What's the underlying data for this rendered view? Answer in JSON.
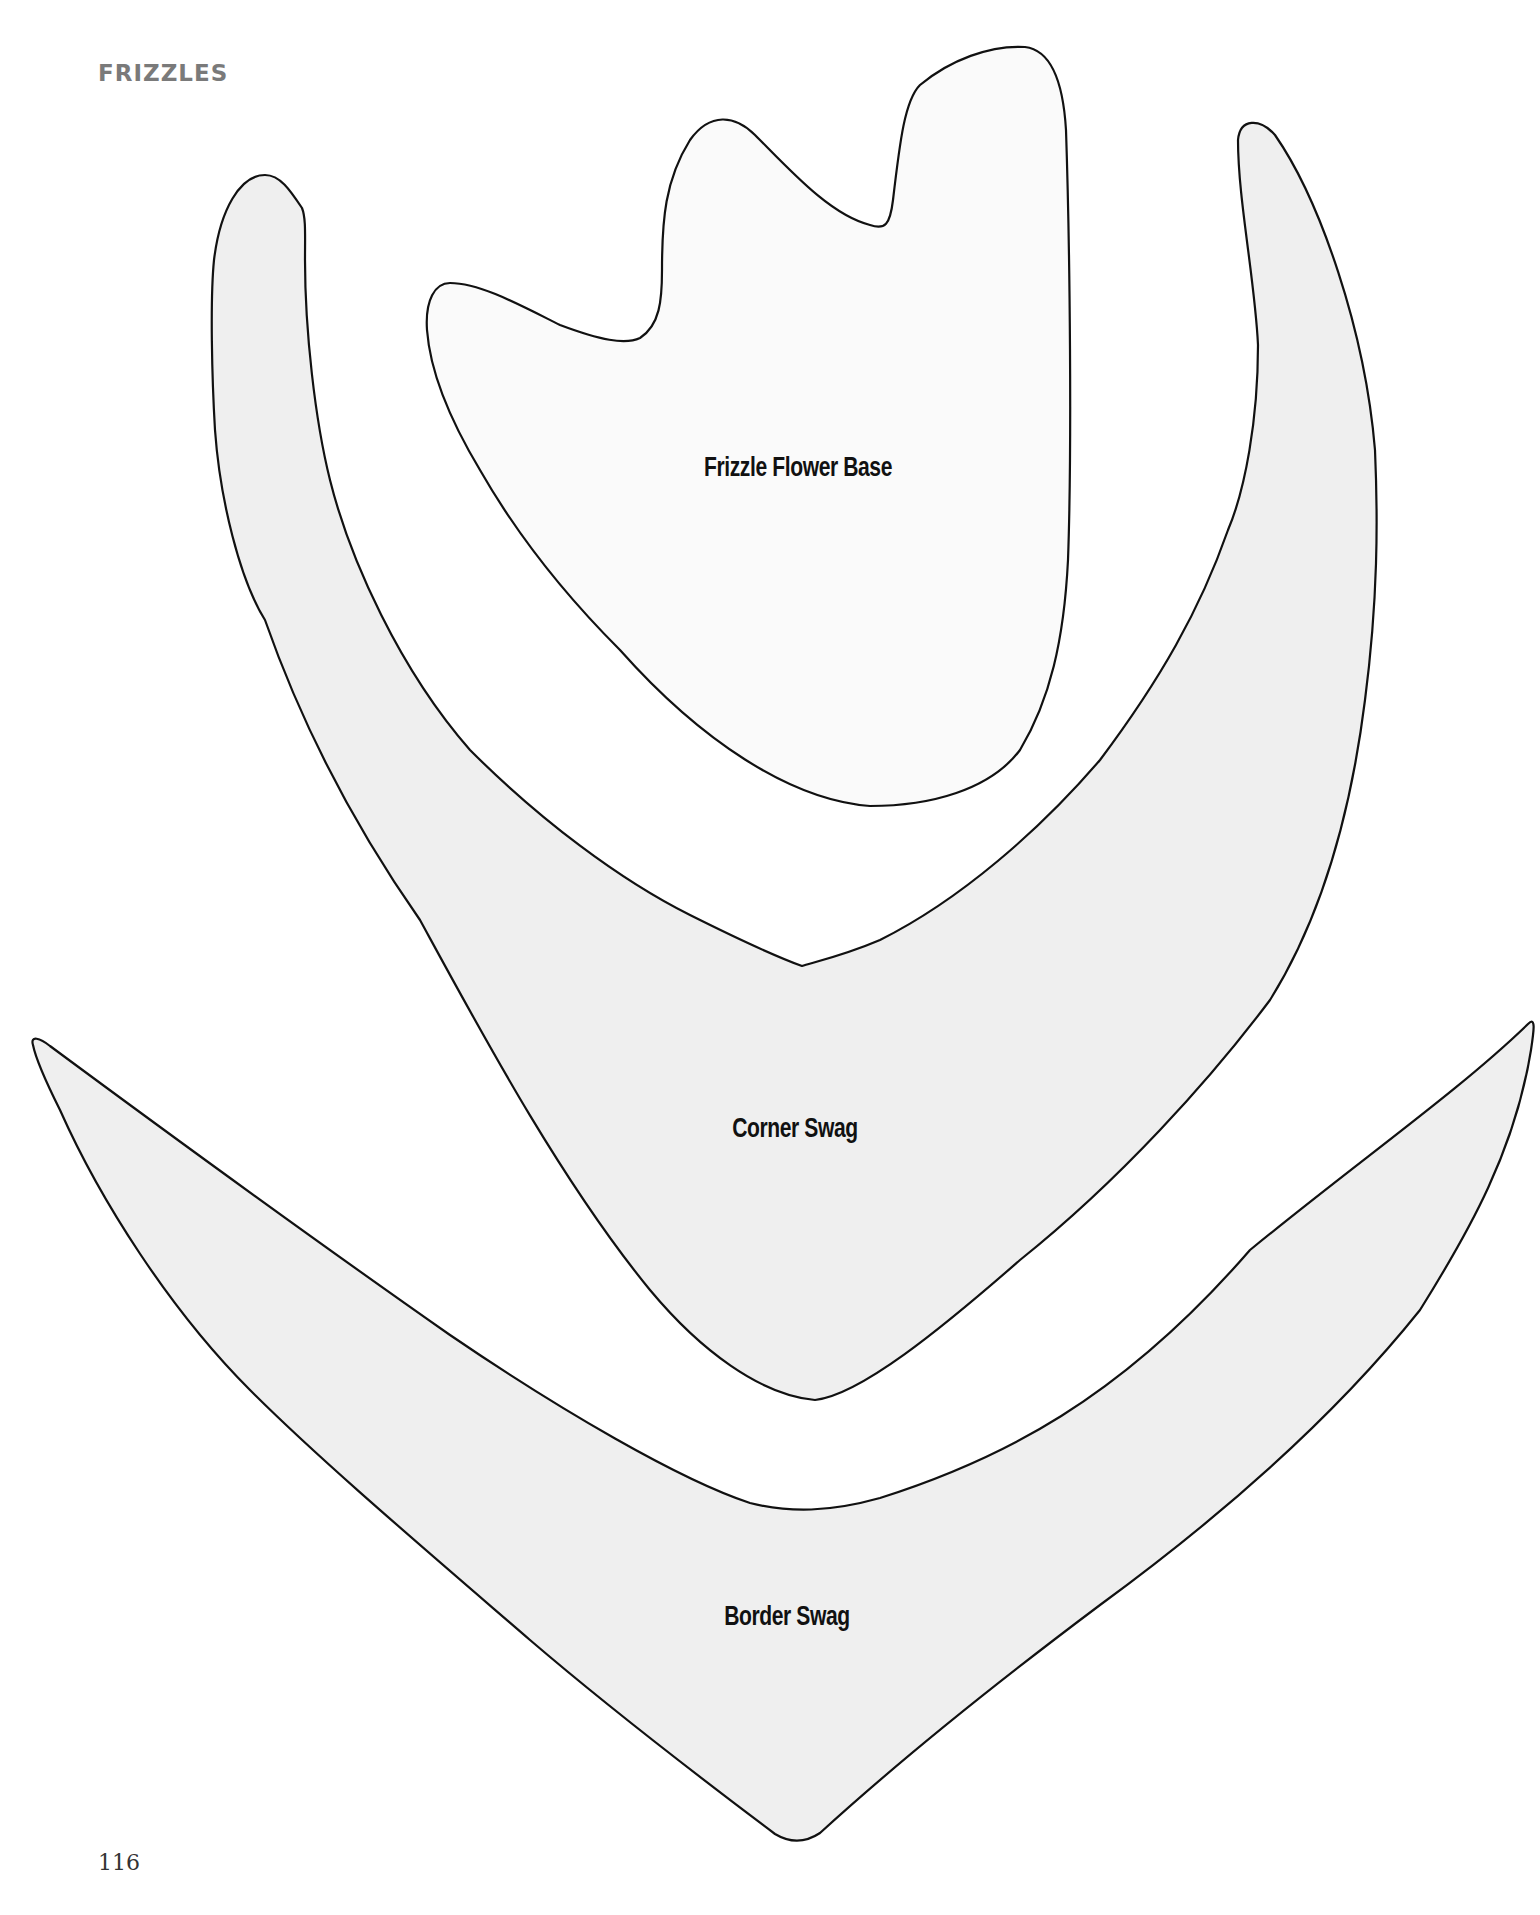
{
  "header": {
    "section_title": "FRIZZLES"
  },
  "footer": {
    "page_number": "116"
  },
  "templates": [
    {
      "id": "frizzle-flower-base",
      "label": "Frizzle Flower Base",
      "fill": "#fafafa",
      "stroke": "#111111"
    },
    {
      "id": "corner-swag",
      "label": "Corner Swag",
      "fill": "#efefef",
      "stroke": "#111111"
    },
    {
      "id": "border-swag",
      "label": "Border Swag",
      "fill": "#efefef",
      "stroke": "#111111"
    }
  ],
  "colors": {
    "background": "#ffffff",
    "heading": "#7a7a7a",
    "outline": "#111111",
    "swag_fill": "#efefef",
    "base_fill": "#fafafa"
  }
}
